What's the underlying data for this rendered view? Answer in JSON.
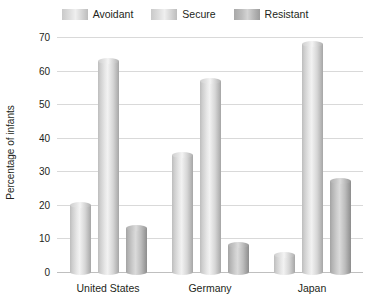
{
  "chart_data": {
    "type": "bar",
    "title": "",
    "xlabel": "",
    "ylabel": "Percentage of infants",
    "categories": [
      "United States",
      "Germany",
      "Japan"
    ],
    "series": [
      {
        "name": "Avoidant",
        "values": [
          20,
          35,
          5
        ],
        "color": "#d9d9d9"
      },
      {
        "name": "Secure",
        "values": [
          63,
          57,
          68
        ],
        "color": "#d9d9d9"
      },
      {
        "name": "Resistant",
        "values": [
          13,
          8,
          27
        ],
        "color": "#b3b3b3"
      }
    ],
    "ylim": [
      0,
      70
    ],
    "yticks": [
      70,
      60,
      50,
      40,
      30,
      20,
      10,
      0
    ],
    "grid": true,
    "legend_position": "top"
  },
  "legend": {
    "items": [
      {
        "label": "Avoidant"
      },
      {
        "label": "Secure"
      },
      {
        "label": "Resistant"
      }
    ]
  },
  "axes": {
    "y_title": "Percentage of infants"
  }
}
